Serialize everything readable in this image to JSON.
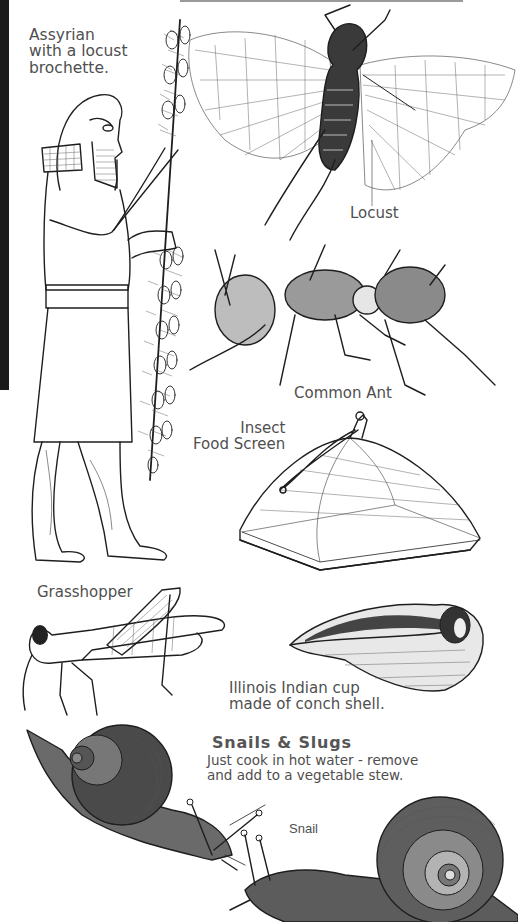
{
  "page": {
    "background": "#ffffff",
    "ink_color": "#1e1e1e",
    "caption_color": "#4f4f4f"
  },
  "captions": {
    "assyrian": "Assyrian with a locust brochette.",
    "assyrian_lines": [
      "Assyrian",
      "with a locust",
      "brochette."
    ],
    "locust": "Locust",
    "common_ant": "Common Ant",
    "food_screen_lines": [
      "Insect",
      "Food Screen"
    ],
    "grasshopper": "Grasshopper",
    "conch_cup_lines": [
      "Illinois Indian cup",
      "made of conch shell."
    ],
    "snails_title": "Snails & Slugs",
    "snails_body_lines": [
      "Just cook in hot water - remove",
      "and add to a vegetable stew."
    ],
    "snail": "Snail"
  },
  "illustrations": [
    {
      "name": "assyrian-figure",
      "subject": "Assyrian man holding locust skewer"
    },
    {
      "name": "locust",
      "subject": "Locust with spread wings"
    },
    {
      "name": "common-ant",
      "subject": "Common ant"
    },
    {
      "name": "insect-food-screen",
      "subject": "Domed mesh food cover"
    },
    {
      "name": "grasshopper",
      "subject": "Grasshopper"
    },
    {
      "name": "conch-shell-cup",
      "subject": "Conch shell cup"
    },
    {
      "name": "snail-left",
      "subject": "Snail"
    },
    {
      "name": "snail-right",
      "subject": "Snail"
    }
  ]
}
